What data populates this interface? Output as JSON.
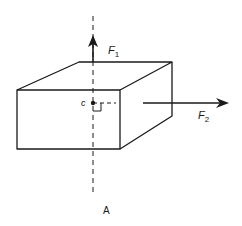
{
  "diagram": {
    "caption": "A",
    "point_label": "c",
    "forces": [
      {
        "name": "F",
        "subscript": "1",
        "direction": "up"
      },
      {
        "name": "F",
        "subscript": "2",
        "direction": "right"
      }
    ],
    "colors": {
      "stroke": "#1a1a1a",
      "background": "#ffffff"
    }
  }
}
